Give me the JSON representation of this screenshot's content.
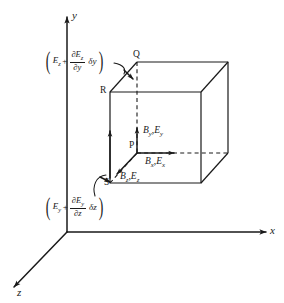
{
  "figure": {
    "background_color": "#ffffff",
    "ink_color": "#1a1a1a"
  },
  "axes": [
    {
      "name": "y-axis",
      "label": "y",
      "direction": "up"
    },
    {
      "name": "x-axis",
      "label": "x",
      "direction": "right"
    },
    {
      "name": "z-axis",
      "label": "z",
      "direction": "down-left"
    }
  ],
  "vertices": [
    {
      "name": "Q",
      "label": "Q",
      "position": "top-back-left"
    },
    {
      "name": "R",
      "label": "R",
      "position": "top-front-left"
    },
    {
      "name": "P",
      "label": "P",
      "position": "center-front"
    },
    {
      "name": "S",
      "label": "S",
      "position": "bottom-front-left"
    }
  ],
  "field_labels": [
    {
      "name": "y-components",
      "base": "B",
      "sub1": "y",
      "sep": ",",
      "base2": "E",
      "sub2": "y",
      "text": "B_y, E_y"
    },
    {
      "name": "x-components",
      "base": "B",
      "sub1": "x",
      "sep": ",",
      "base2": "E",
      "sub2": "x",
      "text": "B_x, E_x"
    },
    {
      "name": "z-components",
      "base": "B",
      "sub1": "z",
      "sep": ",",
      "base2": "E",
      "sub2": "z",
      "text": "B_z, E_z"
    }
  ],
  "annotations": [
    {
      "name": "top-derivative",
      "open_paren": "(",
      "close_paren": ")",
      "term": "E",
      "term_sub": "z",
      "plus": "+",
      "numerator": "∂E",
      "numerator_sub": "z",
      "denominator": "∂y",
      "delta": "δy",
      "full_text": "(E_z + ∂E_z/∂y δy)"
    },
    {
      "name": "bottom-derivative",
      "open_paren": "(",
      "close_paren": ")",
      "term": "E",
      "term_sub": "y",
      "plus": "+",
      "numerator": "∂E",
      "numerator_sub": "y",
      "denominator": "∂z",
      "delta": "δz",
      "full_text": "(E_y + ∂E_y/∂z δz)"
    }
  ]
}
